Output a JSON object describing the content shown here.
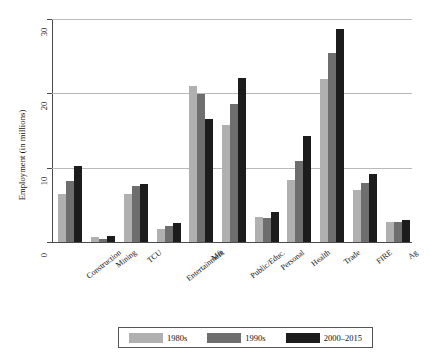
{
  "chart_data": {
    "type": "bar",
    "title": "",
    "xlabel": "",
    "ylabel": "Employment (in millions)",
    "ylim": [
      0,
      30
    ],
    "yticks": [
      0,
      10,
      20,
      30
    ],
    "ytick_labels": [
      "0",
      "10",
      "20",
      "30"
    ],
    "grid": true,
    "legend_position": "bottom",
    "categories": [
      "Construction",
      "Mining",
      "TCU",
      "Entertainment",
      "Mft",
      "Public/Educ.",
      "Personal",
      "Health",
      "Trade",
      "FIRE",
      "Ag"
    ],
    "series": [
      {
        "name": "1980s",
        "color": "#b0b0b0",
        "values": [
          6.5,
          0.7,
          6.5,
          1.7,
          21.0,
          15.7,
          3.4,
          8.3,
          21.9,
          7.0,
          2.7
        ]
      },
      {
        "name": "1990s",
        "color": "#6e6e6e",
        "values": [
          8.2,
          0.35,
          7.6,
          2.1,
          19.9,
          18.6,
          3.2,
          10.9,
          25.4,
          8.0,
          2.7
        ]
      },
      {
        "name": "2000–2015",
        "color": "#1c1c1c",
        "values": [
          10.2,
          0.8,
          7.8,
          2.6,
          16.5,
          22.1,
          4.0,
          14.2,
          28.7,
          9.2,
          2.9
        ]
      }
    ]
  },
  "legend": {
    "items": [
      {
        "label": "1980s",
        "color": "#b0b0b0"
      },
      {
        "label": "1990s",
        "color": "#6e6e6e"
      },
      {
        "label": "2000–2015",
        "color": "#1c1c1c"
      }
    ]
  }
}
